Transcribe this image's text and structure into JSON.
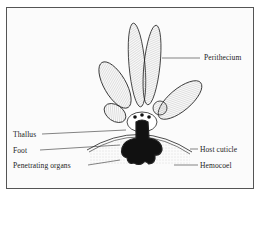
{
  "figure": {
    "labels": {
      "perithecium": "Perithecium",
      "thallus": "Thallus",
      "foot": "Foot",
      "host_cuticle": "Host cuticle",
      "penetrating_organs": "Penetrating organs",
      "hemocoel": "Hemocoel"
    },
    "colors": {
      "ink": "#1a1a1a",
      "frame": "#555555",
      "stipple": "#bbbbbb"
    }
  }
}
